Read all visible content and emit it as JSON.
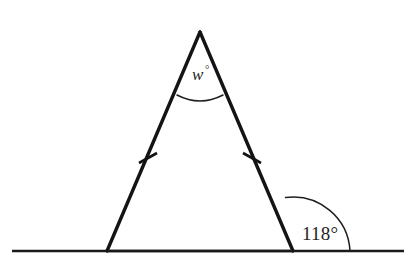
{
  "figure": {
    "background_color": "#ffffff",
    "line_color": "#141414",
    "arc_color": "#1f1f1f",
    "width": 411,
    "height": 267
  },
  "labels": {
    "apex_angle_variable": "w",
    "apex_angle_degree_symbol": "°",
    "exterior_angle": "118°"
  },
  "geometry": {
    "baseline": {
      "x1": 12,
      "y1": 251,
      "x2": 404,
      "y2": 251
    },
    "apex": {
      "x": 200,
      "y": 32
    },
    "left_vertex": {
      "x": 107,
      "y": 251
    },
    "right_vertex": {
      "x": 293,
      "y": 251
    },
    "apex_arc_path": "M 177 95 Q 200 107 223 95",
    "exterior_arc_path": "M 285.5 197.5 A 57 57 0 0 1 350 251",
    "tick_left": {
      "x1": 139,
      "y1": 163,
      "x2": 157,
      "y2": 153
    },
    "tick_right": {
      "x1": 243,
      "y1": 153,
      "x2": 261,
      "y2": 163
    },
    "apex_label_pos": {
      "x": 192,
      "y": 80
    },
    "apex_degree_pos": {
      "x": 205,
      "y": 73
    },
    "exterior_label_pos": {
      "x": 302,
      "y": 240
    }
  }
}
